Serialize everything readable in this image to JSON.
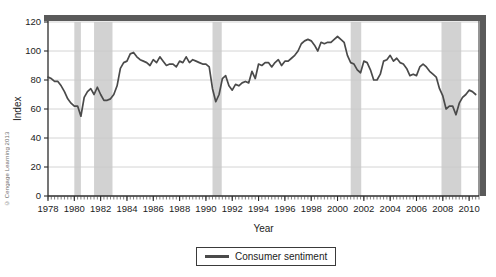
{
  "copyright": "© Cengage Learning 2013",
  "legend": {
    "label": "Consumer sentiment",
    "swatch_color": "#4a4a4a"
  },
  "colors": {
    "line": "#4a4a4a",
    "recession_band": "#d2d2d2",
    "gridline": "#c9c9c9",
    "axis": "#2b2b2b",
    "top_bar": "#5a5a5a",
    "plot_background": "#ffffff"
  },
  "chart_data": {
    "type": "line",
    "title": "",
    "xlabel": "Year",
    "ylabel": "Index",
    "xlim": [
      1978,
      2010.75
    ],
    "ylim": [
      0,
      120
    ],
    "ytick_values": [
      0,
      20,
      40,
      60,
      80,
      100,
      120
    ],
    "ytick_labels": [
      "0",
      "20",
      "40",
      "60",
      "80",
      "100",
      "120"
    ],
    "xtick_values": [
      1978,
      1980,
      1982,
      1984,
      1986,
      1988,
      1990,
      1992,
      1994,
      1996,
      1998,
      2000,
      2002,
      2004,
      2006,
      2008,
      2010
    ],
    "xtick_labels": [
      "1978",
      "1980",
      "1982",
      "1984",
      "1986",
      "1988",
      "1990",
      "1992",
      "1994",
      "1996",
      "1998",
      "2000",
      "2002",
      "2004",
      "2006",
      "2008",
      "2010"
    ],
    "minor_xtick_interval": 0.25,
    "grid": "horizontal",
    "legend_position": "below",
    "series": [
      {
        "name": "Consumer sentiment",
        "color": "#4a4a4a",
        "x": [
          1978.0,
          1978.25,
          1978.5,
          1978.75,
          1979.0,
          1979.25,
          1979.5,
          1979.75,
          1980.0,
          1980.25,
          1980.5,
          1980.75,
          1981.0,
          1981.25,
          1981.5,
          1981.75,
          1982.0,
          1982.25,
          1982.5,
          1982.75,
          1983.0,
          1983.25,
          1983.5,
          1983.75,
          1984.0,
          1984.25,
          1984.5,
          1984.75,
          1985.0,
          1985.25,
          1985.5,
          1985.75,
          1986.0,
          1986.25,
          1986.5,
          1986.75,
          1987.0,
          1987.25,
          1987.5,
          1987.75,
          1988.0,
          1988.25,
          1988.5,
          1988.75,
          1989.0,
          1989.25,
          1989.5,
          1989.75,
          1990.0,
          1990.25,
          1990.5,
          1990.75,
          1991.0,
          1991.25,
          1991.5,
          1991.75,
          1992.0,
          1992.25,
          1992.5,
          1992.75,
          1993.0,
          1993.25,
          1993.5,
          1993.75,
          1994.0,
          1994.25,
          1994.5,
          1994.75,
          1995.0,
          1995.25,
          1995.5,
          1995.75,
          1996.0,
          1996.25,
          1996.5,
          1996.75,
          1997.0,
          1997.25,
          1997.5,
          1997.75,
          1998.0,
          1998.25,
          1998.5,
          1998.75,
          1999.0,
          1999.25,
          1999.5,
          1999.75,
          2000.0,
          2000.25,
          2000.5,
          2000.75,
          2001.0,
          2001.25,
          2001.5,
          2001.75,
          2002.0,
          2002.25,
          2002.5,
          2002.75,
          2003.0,
          2003.25,
          2003.5,
          2003.75,
          2004.0,
          2004.25,
          2004.5,
          2004.75,
          2005.0,
          2005.25,
          2005.5,
          2005.75,
          2006.0,
          2006.25,
          2006.5,
          2006.75,
          2007.0,
          2007.25,
          2007.5,
          2007.75,
          2008.0,
          2008.25,
          2008.5,
          2008.75,
          2009.0,
          2009.25,
          2009.5,
          2009.75,
          2010.0,
          2010.25,
          2010.5
        ],
        "y": [
          82,
          81,
          79,
          79,
          76,
          72,
          67,
          64,
          62,
          62,
          55,
          68,
          72,
          74,
          70,
          75,
          70,
          66,
          66,
          67,
          70,
          76,
          88,
          92,
          93,
          98,
          99,
          96,
          94,
          93,
          92,
          90,
          94,
          92,
          96,
          93,
          90,
          91,
          91,
          89,
          93,
          92,
          96,
          92,
          94,
          93,
          92,
          91,
          91,
          89,
          74,
          65,
          70,
          81,
          83,
          76,
          73,
          77,
          76,
          78,
          79,
          78,
          86,
          81,
          91,
          90,
          92,
          92,
          89,
          92,
          94,
          90,
          93,
          93,
          95,
          97,
          100,
          105,
          107,
          108,
          107,
          104,
          100,
          106,
          105,
          106,
          106,
          108,
          110,
          108,
          106,
          97,
          92,
          91,
          87,
          85,
          93,
          92,
          87,
          80,
          80,
          84,
          93,
          94,
          97,
          93,
          95,
          92,
          91,
          88,
          83,
          84,
          83,
          89,
          91,
          89,
          86,
          84,
          82,
          74,
          69,
          60,
          62,
          62,
          56,
          64,
          68,
          70,
          73,
          72,
          70
        ]
      }
    ],
    "recession_bands": [
      {
        "start": 1980.0,
        "end": 1980.5,
        "label": "1980 recession"
      },
      {
        "start": 1981.5,
        "end": 1982.9,
        "label": "1981-82 recession"
      },
      {
        "start": 1990.5,
        "end": 1991.2,
        "label": "1990-91 recession"
      },
      {
        "start": 2001.0,
        "end": 2001.8,
        "label": "2001 recession"
      },
      {
        "start": 2007.9,
        "end": 2009.4,
        "label": "2007-09 recession"
      }
    ]
  }
}
